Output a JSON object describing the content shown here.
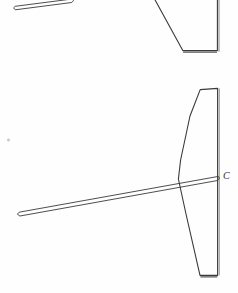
{
  "sheet": {
    "width": 238,
    "height": 293,
    "background_color": "#fefefe",
    "ink_color": "#3a3a3a",
    "ink_color_light": "#6b6b6b",
    "speck_color": "#c9c9c9",
    "title": "Technical line drawing"
  },
  "labels": [
    {
      "id": "label-c",
      "text": "C",
      "x": 223,
      "y": 171,
      "font_size": 10,
      "style": "italic",
      "color": "#2f2f2f"
    }
  ],
  "figures": [
    {
      "id": "figure-upper",
      "name": "upper-view",
      "clipped_at_top": true,
      "parts": [
        {
          "id": "upper-needle",
          "name": "tapered-sliver",
          "type": "outline",
          "stroke_width": 0.9,
          "points": [
            [
              15.0,
              9.5
            ],
            [
              13.6,
              7.8
            ],
            [
              15.2,
              6.3
            ],
            [
              72.0,
              -1.0
            ],
            [
              73.5,
              0.6
            ],
            [
              72.0,
              2.2
            ]
          ]
        },
        {
          "id": "upper-blade-outline",
          "name": "blade-outline",
          "type": "polyline",
          "stroke_width": 1.1,
          "points": [
            [
              154.0,
              -2.0
            ],
            [
              182.8,
              50.6
            ],
            [
              217.4,
              50.6
            ],
            [
              217.4,
              -2.0
            ]
          ]
        },
        {
          "id": "upper-blade-bottom-shadow",
          "name": "blade-bottom-edge-shadow",
          "type": "polyline",
          "stroke_width": 1.3,
          "color": "#5a5a5a",
          "points": [
            [
              183.6,
              52.2
            ],
            [
              216.4,
              52.2
            ]
          ]
        },
        {
          "id": "upper-blade-right-edge-inner",
          "name": "blade-right-edge-inner",
          "type": "polyline",
          "stroke_width": 0.8,
          "color": "#6b6b6b",
          "points": [
            [
              219.0,
              -2.0
            ],
            [
              219.0,
              51.4
            ]
          ]
        }
      ]
    },
    {
      "id": "figure-lower",
      "name": "lower-view",
      "clipped_at_top": false,
      "parts": [
        {
          "id": "lower-blade-outline",
          "name": "blade-outline",
          "type": "polygon",
          "stroke_width": 1.1,
          "points": [
            [
              200.2,
              89.6
            ],
            [
              217.6,
              88.4
            ],
            [
              217.6,
              275.4
            ],
            [
              200.0,
              275.4
            ],
            [
              186.0,
              214.0
            ],
            [
              178.4,
              179.0
            ],
            [
              180.6,
              160.0
            ],
            [
              190.0,
              116.0
            ]
          ]
        },
        {
          "id": "lower-blade-right-edge-inner",
          "name": "blade-right-edge-inner",
          "type": "polyline",
          "stroke_width": 0.8,
          "color": "#6b6b6b",
          "points": [
            [
              219.2,
              88.8
            ],
            [
              219.2,
              275.0
            ]
          ]
        },
        {
          "id": "lower-blade-bottom-shadow",
          "name": "blade-bottom-edge-shadow",
          "type": "polyline",
          "stroke_width": 1.2,
          "color": "#5a5a5a",
          "points": [
            [
              200.8,
              276.8
            ],
            [
              217.0,
              276.8
            ]
          ]
        },
        {
          "id": "lower-needle",
          "name": "tapered-sliver",
          "type": "outline",
          "stroke_width": 0.9,
          "points": [
            [
              19.6,
              215.8
            ],
            [
              17.4,
              214.2
            ],
            [
              19.2,
              212.2
            ],
            [
              218.4,
              176.4
            ],
            [
              219.4,
              178.2
            ],
            [
              217.8,
              180.2
            ]
          ]
        }
      ]
    }
  ],
  "artifacts": [
    {
      "id": "speck-1",
      "name": "scan-speck",
      "x": 8.5,
      "y": 140.0,
      "radius": 1.6,
      "color": "#c9c9c9"
    }
  ]
}
